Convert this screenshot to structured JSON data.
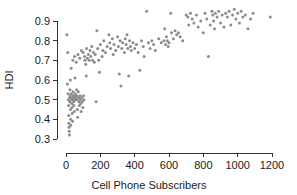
{
  "chart_data": {
    "type": "scatter",
    "title": "",
    "xlabel": "Cell Phone Subscribers",
    "ylabel": "HDI",
    "xlim": [
      -60,
      1260
    ],
    "ylim": [
      0.28,
      0.97
    ],
    "xticks": [
      0,
      200,
      400,
      600,
      800,
      1000,
      1200
    ],
    "xticklabels": [
      "0",
      "200",
      "400",
      "600",
      "800",
      "1000",
      "1200"
    ],
    "yticks": [
      0.3,
      0.4,
      0.5,
      0.6,
      0.7,
      0.8,
      0.9
    ],
    "yticklabels": [
      "0.3",
      "0.4",
      "0.5",
      "0.6",
      "0.7",
      "0.8",
      "0.9"
    ],
    "grid": false,
    "legend": null,
    "marker": {
      "shape": "circle",
      "color": "#8c8c8c",
      "size": 3.0
    },
    "points": [
      [
        5,
        0.83
      ],
      [
        8,
        0.58
      ],
      [
        10,
        0.74
      ],
      [
        12,
        0.53
      ],
      [
        14,
        0.5
      ],
      [
        15,
        0.47
      ],
      [
        16,
        0.42
      ],
      [
        17,
        0.38
      ],
      [
        18,
        0.36
      ],
      [
        19,
        0.34
      ],
      [
        20,
        0.32
      ],
      [
        21,
        0.51
      ],
      [
        22,
        0.49
      ],
      [
        23,
        0.55
      ],
      [
        24,
        0.52
      ],
      [
        25,
        0.6
      ],
      [
        26,
        0.45
      ],
      [
        27,
        0.4
      ],
      [
        28,
        0.37
      ],
      [
        30,
        0.66
      ],
      [
        31,
        0.53
      ],
      [
        32,
        0.51
      ],
      [
        33,
        0.5
      ],
      [
        34,
        0.48
      ],
      [
        35,
        0.46
      ],
      [
        36,
        0.43
      ],
      [
        38,
        0.39
      ],
      [
        40,
        0.7
      ],
      [
        41,
        0.54
      ],
      [
        42,
        0.52
      ],
      [
        43,
        0.51
      ],
      [
        44,
        0.5
      ],
      [
        45,
        0.49
      ],
      [
        46,
        0.47
      ],
      [
        48,
        0.44
      ],
      [
        50,
        0.72
      ],
      [
        52,
        0.61
      ],
      [
        54,
        0.53
      ],
      [
        55,
        0.52
      ],
      [
        56,
        0.51
      ],
      [
        58,
        0.5
      ],
      [
        60,
        0.69
      ],
      [
        62,
        0.55
      ],
      [
        64,
        0.52
      ],
      [
        65,
        0.5
      ],
      [
        66,
        0.45
      ],
      [
        68,
        0.41
      ],
      [
        70,
        0.73
      ],
      [
        72,
        0.54
      ],
      [
        74,
        0.51
      ],
      [
        75,
        0.49
      ],
      [
        78,
        0.47
      ],
      [
        80,
        0.71
      ],
      [
        82,
        0.52
      ],
      [
        84,
        0.5
      ],
      [
        86,
        0.48
      ],
      [
        88,
        0.44
      ],
      [
        90,
        0.75
      ],
      [
        92,
        0.51
      ],
      [
        95,
        0.49
      ],
      [
        98,
        0.46
      ],
      [
        100,
        0.74
      ],
      [
        102,
        0.52
      ],
      [
        105,
        0.5
      ],
      [
        108,
        0.72
      ],
      [
        110,
        0.7
      ],
      [
        115,
        0.68
      ],
      [
        118,
        0.62
      ],
      [
        120,
        0.76
      ],
      [
        125,
        0.71
      ],
      [
        130,
        0.73
      ],
      [
        135,
        0.7
      ],
      [
        140,
        0.75
      ],
      [
        145,
        0.72
      ],
      [
        150,
        0.77
      ],
      [
        155,
        0.7
      ],
      [
        160,
        0.74
      ],
      [
        165,
        0.69
      ],
      [
        170,
        0.73
      ],
      [
        175,
        0.49
      ],
      [
        180,
        0.85
      ],
      [
        185,
        0.76
      ],
      [
        190,
        0.7
      ],
      [
        195,
        0.64
      ],
      [
        200,
        0.78
      ],
      [
        210,
        0.72
      ],
      [
        215,
        0.75
      ],
      [
        220,
        0.8
      ],
      [
        230,
        0.74
      ],
      [
        240,
        0.77
      ],
      [
        250,
        0.83
      ],
      [
        255,
        0.79
      ],
      [
        260,
        0.76
      ],
      [
        270,
        0.81
      ],
      [
        275,
        0.73
      ],
      [
        280,
        0.78
      ],
      [
        290,
        0.75
      ],
      [
        300,
        0.82
      ],
      [
        305,
        0.77
      ],
      [
        310,
        0.63
      ],
      [
        315,
        0.8
      ],
      [
        320,
        0.57
      ],
      [
        325,
        0.76
      ],
      [
        330,
        0.79
      ],
      [
        340,
        0.74
      ],
      [
        345,
        0.81
      ],
      [
        350,
        0.78
      ],
      [
        355,
        0.83
      ],
      [
        360,
        0.76
      ],
      [
        365,
        0.62
      ],
      [
        370,
        0.8
      ],
      [
        375,
        0.77
      ],
      [
        380,
        0.75
      ],
      [
        390,
        0.79
      ],
      [
        400,
        0.76
      ],
      [
        410,
        0.78
      ],
      [
        420,
        0.74
      ],
      [
        430,
        0.65
      ],
      [
        440,
        0.8
      ],
      [
        450,
        0.77
      ],
      [
        455,
        0.72
      ],
      [
        470,
        0.95
      ],
      [
        480,
        0.79
      ],
      [
        490,
        0.76
      ],
      [
        500,
        0.8
      ],
      [
        510,
        0.78
      ],
      [
        520,
        0.75
      ],
      [
        540,
        0.81
      ],
      [
        555,
        0.79
      ],
      [
        570,
        0.8
      ],
      [
        575,
        0.86
      ],
      [
        580,
        0.78
      ],
      [
        585,
        0.82
      ],
      [
        590,
        0.8
      ],
      [
        595,
        0.77
      ],
      [
        600,
        0.79
      ],
      [
        610,
        0.94
      ],
      [
        615,
        0.84
      ],
      [
        625,
        0.81
      ],
      [
        635,
        0.85
      ],
      [
        645,
        0.83
      ],
      [
        655,
        0.84
      ],
      [
        665,
        0.82
      ],
      [
        680,
        0.8
      ],
      [
        700,
        0.93
      ],
      [
        710,
        0.92
      ],
      [
        715,
        0.88
      ],
      [
        725,
        0.94
      ],
      [
        735,
        0.91
      ],
      [
        745,
        0.89
      ],
      [
        760,
        0.93
      ],
      [
        770,
        0.87
      ],
      [
        785,
        0.9
      ],
      [
        800,
        0.84
      ],
      [
        810,
        0.94
      ],
      [
        820,
        0.91
      ],
      [
        830,
        0.72
      ],
      [
        840,
        0.88
      ],
      [
        850,
        0.95
      ],
      [
        855,
        0.93
      ],
      [
        860,
        0.9
      ],
      [
        865,
        0.86
      ],
      [
        870,
        0.94
      ],
      [
        880,
        0.92
      ],
      [
        890,
        0.95
      ],
      [
        900,
        0.89
      ],
      [
        910,
        0.93
      ],
      [
        920,
        0.87
      ],
      [
        930,
        0.94
      ],
      [
        940,
        0.92
      ],
      [
        950,
        0.95
      ],
      [
        960,
        0.88
      ],
      [
        970,
        0.93
      ],
      [
        980,
        0.96
      ],
      [
        990,
        0.91
      ],
      [
        1000,
        0.94
      ],
      [
        1010,
        0.89
      ],
      [
        1020,
        0.95
      ],
      [
        1030,
        0.92
      ],
      [
        1045,
        0.93
      ],
      [
        1060,
        0.86
      ],
      [
        1075,
        0.91
      ],
      [
        1090,
        0.94
      ],
      [
        1190,
        0.92
      ]
    ]
  }
}
